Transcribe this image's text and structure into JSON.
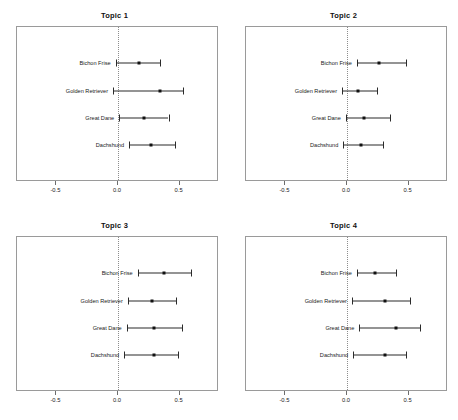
{
  "figure": {
    "panels_across": 2,
    "panels_down": 2,
    "background": "#ffffff",
    "point_color": "#111111",
    "line_color": "#2b2b2b",
    "zero_line_color": "#8d8d8d",
    "frame_color": "#9a9a9a"
  },
  "axis": {
    "ticks": [
      -0.5,
      0.0,
      0.5
    ],
    "tick_labels": [
      "-0.5",
      "0.0",
      "0.5"
    ],
    "xlim": [
      -0.82,
      0.82
    ],
    "zero_reference": 0.0
  },
  "chart_data": [
    {
      "type": "scatter",
      "title": "Topic 1",
      "xlabel": "",
      "ylabel": "",
      "xlim": [
        -0.82,
        0.82
      ],
      "ticks": [
        -0.5,
        0.0,
        0.5
      ],
      "grid": false,
      "legend": "none",
      "categories": [
        "Bichon Frise",
        "Golden Retriever",
        "Great Dane",
        "Dachshund"
      ],
      "values": [
        0.17,
        0.34,
        0.21,
        0.27
      ],
      "ci_low": [
        -0.02,
        -0.04,
        0.01,
        0.09
      ],
      "ci_high": [
        0.34,
        0.53,
        0.41,
        0.46
      ]
    },
    {
      "type": "scatter",
      "title": "Topic 2",
      "xlabel": "",
      "ylabel": "",
      "xlim": [
        -0.82,
        0.82
      ],
      "ticks": [
        -0.5,
        0.0,
        0.5
      ],
      "grid": false,
      "legend": "none",
      "categories": [
        "Bichon Frise",
        "Golden Retriever",
        "Great Dane",
        "Dachshund"
      ],
      "values": [
        0.26,
        0.09,
        0.14,
        0.11
      ],
      "ci_low": [
        0.08,
        -0.04,
        -0.01,
        -0.03
      ],
      "ci_high": [
        0.48,
        0.24,
        0.35,
        0.29
      ]
    },
    {
      "type": "scatter",
      "title": "Topic 3",
      "xlabel": "",
      "ylabel": "",
      "xlim": [
        -0.82,
        0.82
      ],
      "ticks": [
        -0.5,
        0.0,
        0.5
      ],
      "grid": false,
      "legend": "none",
      "categories": [
        "Bichon Frise",
        "Golden Retriever",
        "Great Dane",
        "Dachshund"
      ],
      "values": [
        0.37,
        0.28,
        0.29,
        0.29
      ],
      "ci_low": [
        0.16,
        0.08,
        0.07,
        0.05
      ],
      "ci_high": [
        0.59,
        0.47,
        0.52,
        0.49
      ]
    },
    {
      "type": "scatter",
      "title": "Topic 4",
      "xlabel": "",
      "ylabel": "",
      "xlim": [
        -0.82,
        0.82
      ],
      "ticks": [
        -0.5,
        0.0,
        0.5
      ],
      "grid": false,
      "legend": "none",
      "categories": [
        "Bichon Frise",
        "Golden Retriever",
        "Great Dane",
        "Dachshund"
      ],
      "values": [
        0.23,
        0.31,
        0.4,
        0.31
      ],
      "ci_low": [
        0.08,
        0.04,
        0.1,
        0.05
      ],
      "ci_high": [
        0.4,
        0.51,
        0.59,
        0.48
      ]
    }
  ]
}
